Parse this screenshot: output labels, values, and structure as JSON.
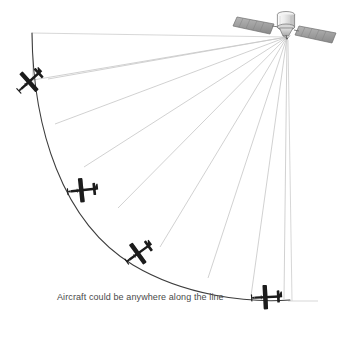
{
  "figure": {
    "type": "technical-diagram",
    "background_color": "#ffffff",
    "caption": "Aircraft could be anywhere along the line",
    "caption_color": "#4a4a4a"
  },
  "satellite": {
    "name": "satellite",
    "body_color": "#e8e8e8",
    "panel_color": "#9a9a9a",
    "outline_color": "#6b6b6b",
    "position": {
      "x": 287,
      "y": 37
    },
    "parts": [
      {
        "name": "solar-panel-left",
        "label": "Solar panel"
      },
      {
        "name": "solar-panel-right",
        "label": "Solar panel"
      },
      {
        "name": "satellite-body",
        "label": "Bus"
      },
      {
        "name": "satellite-antenna",
        "label": "Antenna"
      }
    ]
  },
  "signal_fan": {
    "name": "signal-rays",
    "origin": {
      "x": 287,
      "y": 37
    },
    "ray_color": "#c9c9c9",
    "ray_count": 9,
    "rays": [
      {
        "x": 32,
        "y": 33
      },
      {
        "x": 33,
        "y": 80
      },
      {
        "x": 48,
        "y": 79
      },
      {
        "x": 55,
        "y": 123
      },
      {
        "x": 84,
        "y": 166
      },
      {
        "x": 118,
        "y": 207
      },
      {
        "x": 160,
        "y": 246
      },
      {
        "x": 208,
        "y": 277
      },
      {
        "x": 251,
        "y": 296
      },
      {
        "x": 290,
        "y": 300
      }
    ]
  },
  "arc": {
    "name": "uncertainty-arc",
    "color": "#3c3c3c",
    "start": {
      "x": 32,
      "y": 33
    },
    "end": {
      "x": 290,
      "y": 300
    },
    "description": "Locus of possible aircraft positions"
  },
  "frame_lines": {
    "name": "frame-lines",
    "color": "#d2d2d2",
    "top_edge": {
      "x1": 32,
      "y1": 33,
      "x2": 287,
      "y2": 37
    },
    "right_edge": {
      "x1": 287,
      "y1": 37,
      "x2": 292,
      "y2": 301
    },
    "bottom_stub": {
      "x1": 290,
      "y1": 300,
      "x2": 318,
      "y2": 301
    }
  },
  "aircraft": [
    {
      "name": "aircraft-1",
      "label": "Aircraft position 1",
      "x": 31,
      "y": 80,
      "rotation": -42,
      "scale": 0.92,
      "color": "#1c1c1c"
    },
    {
      "name": "aircraft-2",
      "label": "Aircraft position 2",
      "x": 84,
      "y": 190,
      "rotation": -6,
      "scale": 0.92,
      "color": "#1c1c1c"
    },
    {
      "name": "aircraft-3",
      "label": "Aircraft position 3",
      "x": 140,
      "y": 252,
      "rotation": -36,
      "scale": 0.92,
      "color": "#1c1c1c"
    },
    {
      "name": "aircraft-4",
      "label": "Aircraft position 4",
      "x": 268,
      "y": 297,
      "rotation": -3,
      "scale": 0.92,
      "color": "#1c1c1c"
    }
  ]
}
